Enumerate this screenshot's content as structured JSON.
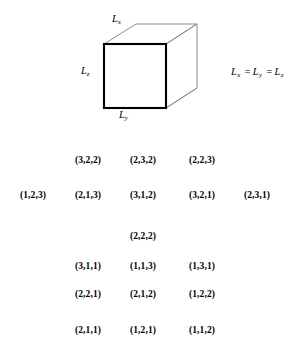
{
  "figure": {
    "name": "cubic-box-diagram",
    "shape": "cube",
    "labels": {
      "top_edge": "L",
      "top_edge_sub": "x",
      "left_edge": "L",
      "left_edge_sub": "z",
      "bottom_edge": "L",
      "bottom_edge_sub": "y"
    },
    "equation": {
      "term1": "L",
      "term1_sub": "x",
      "op1": "=",
      "term2": "L",
      "term2_sub": "y",
      "op2": "=",
      "term3": "L",
      "term3_sub": "z"
    },
    "colors": {
      "front_face_stroke": "#000000",
      "hidden_edge_stroke": "#8c8c8c",
      "fill": "#ffffff",
      "text": "#000000",
      "background": "#ffffff"
    }
  },
  "triplets": {
    "name": "quantum-number-degeneracy-table",
    "rows": [
      {
        "row_index": 0,
        "cells": [
          {
            "col": 1,
            "value": "(3,2,2)"
          },
          {
            "col": 2,
            "value": "(2,3,2)"
          },
          {
            "col": 3,
            "value": "(2,2,3)"
          }
        ]
      },
      {
        "row_index": 1,
        "cells": [
          {
            "col": 0,
            "value": "(1,2,3)"
          },
          {
            "col": 1,
            "value": "(2,1,3)"
          },
          {
            "col": 2,
            "value": "(3,1,2)"
          },
          {
            "col": 3,
            "value": "(3,2,1)"
          },
          {
            "col": 4,
            "value": "(2,3,1)"
          }
        ]
      },
      {
        "row_index": 2,
        "cells": [
          {
            "col": 2,
            "value": "(2,2,2)"
          }
        ]
      },
      {
        "row_index": 3,
        "cells": [
          {
            "col": 1,
            "value": "(3,1,1)"
          },
          {
            "col": 2,
            "value": "(1,1,3)"
          },
          {
            "col": 3,
            "value": "(1,3,1)"
          }
        ]
      },
      {
        "row_index": 4,
        "cells": [
          {
            "col": 1,
            "value": "(2,2,1)"
          },
          {
            "col": 2,
            "value": "(2,1,2)"
          },
          {
            "col": 3,
            "value": "(1,2,2)"
          }
        ]
      },
      {
        "row_index": 5,
        "cells": [
          {
            "col": 1,
            "value": "(2,1,1)"
          },
          {
            "col": 2,
            "value": "(1,2,1)"
          },
          {
            "col": 3,
            "value": "(1,1,2)"
          }
        ]
      }
    ]
  }
}
